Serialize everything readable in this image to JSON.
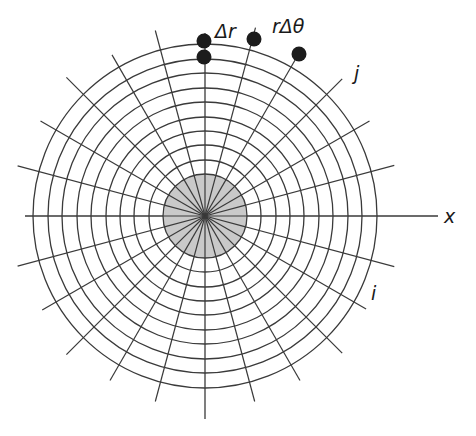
{
  "figure": {
    "type": "polar-grid-diagram",
    "center": {
      "x": 205,
      "y": 216
    },
    "core": {
      "radius": 42,
      "fill": "#c9c9c9",
      "description": "shaded central disk"
    },
    "rings": [
      56,
      71,
      85,
      99,
      114,
      128,
      143,
      157,
      172
    ],
    "radial_lines": {
      "count": 24,
      "step_deg": 15,
      "length": 192
    },
    "axis": {
      "x_start": 25,
      "x_end": 438,
      "y_start": 33,
      "y_end": 419
    },
    "line_color": "#3a3a3a",
    "node_color": "#1c1c1c",
    "nodes": [
      {
        "x": 204,
        "y": 41,
        "group": "delta-r"
      },
      {
        "x": 204,
        "y": 57,
        "group": "delta-r"
      },
      {
        "x": 254,
        "y": 39,
        "group": "r-delta-theta"
      },
      {
        "x": 299,
        "y": 54,
        "group": "r-delta-theta"
      }
    ]
  },
  "labels": {
    "delta_r": "Δr",
    "r_delta_theta": "rΔθ",
    "j": "j",
    "i": "i",
    "x_axis": "x"
  }
}
